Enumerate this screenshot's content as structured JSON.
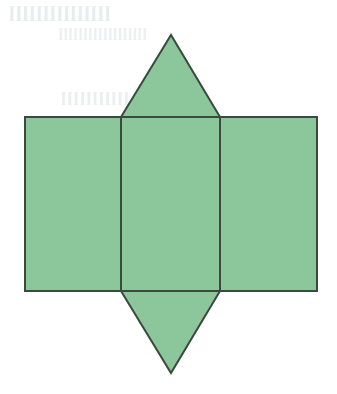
{
  "canvas": {
    "width": 337,
    "height": 394,
    "background_color": "#ffffff"
  },
  "figure": {
    "name": "net-of-a-solid",
    "fill_color": "#8cc79b",
    "stroke_color": "#3a4a3e",
    "stroke_width": 2,
    "shapes": [
      {
        "name": "left-square",
        "type": "rect",
        "x": 25,
        "y": 117,
        "width": 96,
        "height": 174
      },
      {
        "name": "center-square",
        "type": "rect",
        "x": 121,
        "y": 117,
        "width": 99,
        "height": 174
      },
      {
        "name": "right-square",
        "type": "rect",
        "x": 220,
        "y": 117,
        "width": 97,
        "height": 174
      },
      {
        "name": "top-triangle",
        "type": "polygon",
        "points": "121,117 171,35 220,117"
      },
      {
        "name": "bottom-triangle",
        "type": "polygon",
        "points": "121,291 220,291 171,373"
      }
    ]
  },
  "bleed_through": {
    "visible": true,
    "note": "faint mirrored ink showing through the scanned paper, illegible",
    "line_1": "lllllllllllllll",
    "line_2": "llllllllllllllllll",
    "line_3": "lllllllllll"
  }
}
